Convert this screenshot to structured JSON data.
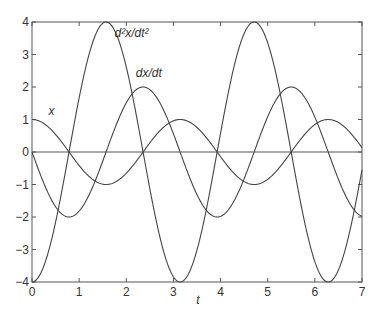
{
  "chart_data": {
    "type": "line",
    "title": "",
    "xlabel": "t",
    "ylabel": "",
    "xlim": [
      0,
      7
    ],
    "ylim": [
      -4,
      4
    ],
    "xticks": [
      0,
      1,
      2,
      3,
      4,
      5,
      6,
      7
    ],
    "yticks": [
      -4,
      -3,
      -2,
      -1,
      0,
      1,
      2,
      3,
      4
    ],
    "grid": false,
    "zero_line": true,
    "legend": "none (inline curve labels)",
    "series": [
      {
        "name": "x",
        "label": "x",
        "formula": "cos(2t)",
        "label_pos": [
          0.35,
          1.15
        ],
        "x": [
          0,
          0.5,
          1,
          1.5,
          2,
          2.5,
          3,
          3.5,
          4,
          4.5,
          5,
          5.5,
          6,
          6.5,
          7
        ],
        "values": [
          1.0,
          0.54,
          -0.42,
          -0.99,
          -0.65,
          0.28,
          0.96,
          0.75,
          -0.15,
          -0.91,
          -0.84,
          0.0,
          0.84,
          0.91,
          0.14
        ]
      },
      {
        "name": "dx/dt",
        "label": "dx/dt",
        "formula": "-2 sin(2t)",
        "label_pos": [
          2.2,
          2.3
        ],
        "x": [
          0,
          0.5,
          1,
          1.5,
          2,
          2.5,
          3,
          3.5,
          4,
          4.5,
          5,
          5.5,
          6,
          6.5,
          7
        ],
        "values": [
          0.0,
          -1.68,
          -1.82,
          -0.28,
          1.51,
          1.92,
          0.56,
          -1.31,
          -1.98,
          -0.82,
          1.09,
          2.0,
          1.07,
          -0.84,
          -1.98
        ]
      },
      {
        "name": "d2x/dt2",
        "label": "d²x/dt²",
        "formula": "-4 cos(2t)",
        "label_pos": [
          1.75,
          3.55
        ],
        "x": [
          0,
          0.5,
          1,
          1.5,
          2,
          2.5,
          3,
          3.5,
          4,
          4.5,
          5,
          5.5,
          6,
          6.5,
          7
        ],
        "values": [
          -4.0,
          -2.16,
          1.66,
          3.96,
          2.61,
          -1.13,
          -3.84,
          -3.02,
          0.58,
          3.64,
          3.36,
          0.02,
          -3.38,
          -3.62,
          -0.55
        ]
      }
    ]
  },
  "colors": {
    "line": "#444444",
    "axis": "#555555",
    "text": "#333333",
    "background": "#ffffff"
  }
}
